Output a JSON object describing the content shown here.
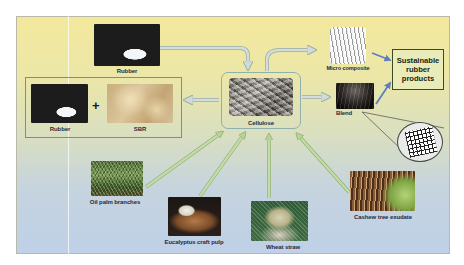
{
  "diagram": {
    "center": {
      "label": "Cellulose"
    },
    "inputs_top": [
      {
        "label": "Rubber"
      }
    ],
    "left_group": {
      "items": [
        {
          "label": "Rubber"
        },
        {
          "label": "SBR"
        }
      ],
      "operator": "+"
    },
    "outputs": [
      {
        "label": "Micro composite"
      },
      {
        "label": "Blend"
      }
    ],
    "product": {
      "lines": [
        "Sustainable",
        "rubber",
        "products"
      ]
    },
    "sources_bottom": [
      {
        "label": "Oil palm branches"
      },
      {
        "label": "Eucalyptus craft pulp"
      },
      {
        "label": "Wheat straw"
      },
      {
        "label": "Cashew tree exudate"
      }
    ],
    "colors": {
      "source_arrow": "#b5cf95",
      "process_arrow": "#bcc8c4",
      "product_arrow": "#6f8fc4",
      "product_border": "#3e4b1e",
      "label_text": "#1f2a44"
    }
  }
}
